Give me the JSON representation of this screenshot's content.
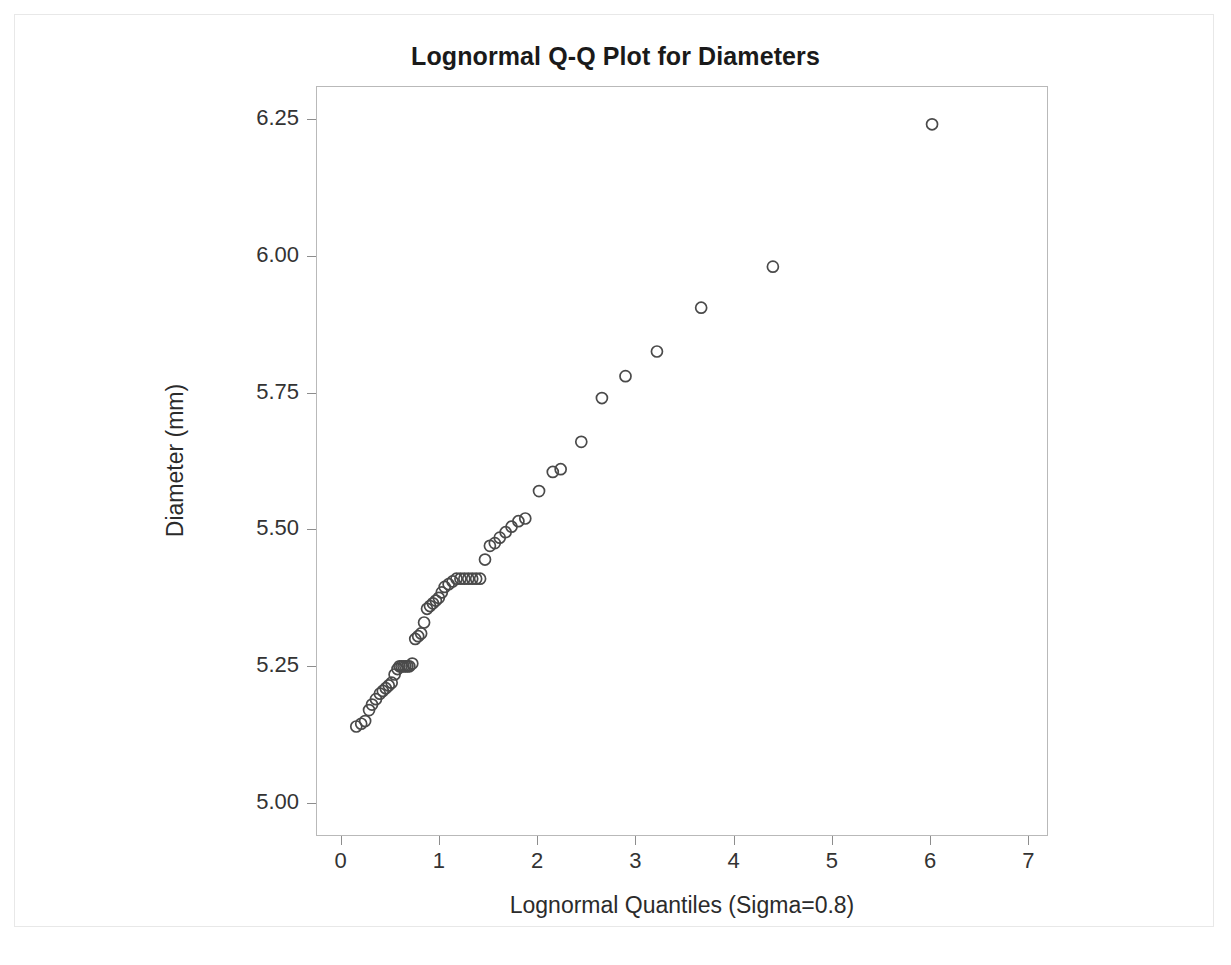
{
  "chart_data": {
    "type": "scatter",
    "title": "Lognormal Q-Q Plot for Diameters",
    "xlabel": "Lognormal Quantiles (Sigma=0.8)",
    "ylabel": "Diameter (mm)",
    "xlim": [
      -0.25,
      7.2
    ],
    "ylim": [
      4.94,
      6.31
    ],
    "xticks": [
      0,
      1,
      2,
      3,
      4,
      5,
      6,
      7
    ],
    "xtick_labels": [
      "0",
      "1",
      "2",
      "3",
      "4",
      "5",
      "6",
      "7"
    ],
    "yticks": [
      5.0,
      5.25,
      5.5,
      5.75,
      6.0,
      6.25
    ],
    "ytick_labels": [
      "5.00",
      "5.25",
      "5.50",
      "5.75",
      "6.00",
      "6.25"
    ],
    "grid": false,
    "legend": null,
    "marker": "open-circle",
    "marker_size_px": 11,
    "marker_color": "#4a4a4a",
    "series": [
      {
        "name": "Diameters",
        "x": [
          0.16,
          0.21,
          0.25,
          0.29,
          0.32,
          0.36,
          0.4,
          0.43,
          0.46,
          0.49,
          0.52,
          0.55,
          0.58,
          0.6,
          0.62,
          0.64,
          0.66,
          0.68,
          0.7,
          0.73,
          0.76,
          0.79,
          0.82,
          0.85,
          0.88,
          0.91,
          0.94,
          0.97,
          1.0,
          1.03,
          1.06,
          1.1,
          1.14,
          1.18,
          1.22,
          1.26,
          1.3,
          1.34,
          1.38,
          1.42,
          1.47,
          1.52,
          1.57,
          1.62,
          1.68,
          1.74,
          1.81,
          1.88,
          2.02,
          2.16,
          2.24,
          2.45,
          2.66,
          2.9,
          3.22,
          3.67,
          4.4,
          6.02
        ],
        "y": [
          5.14,
          5.145,
          5.15,
          5.17,
          5.18,
          5.19,
          5.2,
          5.205,
          5.21,
          5.215,
          5.22,
          5.235,
          5.245,
          5.25,
          5.25,
          5.25,
          5.25,
          5.25,
          5.25,
          5.255,
          5.3,
          5.305,
          5.31,
          5.33,
          5.355,
          5.36,
          5.365,
          5.37,
          5.375,
          5.385,
          5.395,
          5.4,
          5.405,
          5.41,
          5.41,
          5.41,
          5.41,
          5.41,
          5.41,
          5.41,
          5.445,
          5.47,
          5.475,
          5.485,
          5.495,
          5.505,
          5.515,
          5.52,
          5.57,
          5.605,
          5.61,
          5.66,
          5.74,
          5.78,
          5.825,
          5.905,
          5.98,
          6.24
        ]
      }
    ]
  },
  "page": {
    "background_color": "#ffffff",
    "frame_color": "#e8e8e8",
    "axis_color": "#b9b9b9",
    "text_color": "#2b2b2b",
    "title_color": "#1a1a1a"
  }
}
